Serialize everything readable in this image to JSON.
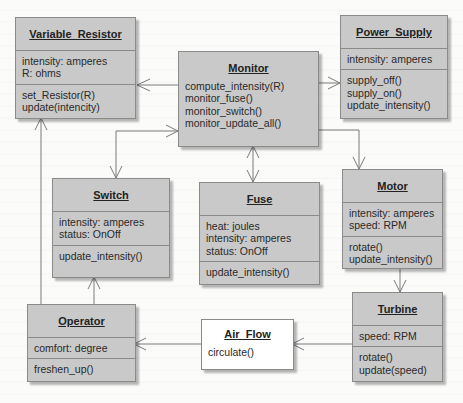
{
  "diagram": {
    "type": "UML class diagram",
    "colors": {
      "class_fill": "#c9c9c9",
      "class_border": "#8a8a8a",
      "air_flow_fill": "#ffffff",
      "connector": "#7a7a7a",
      "background": "#fbfbfa"
    },
    "classes": {
      "variable_resistor": {
        "name": "Variable_Resistor",
        "attributes": [
          "intensity:  amperes",
          "R:  ohms"
        ],
        "operations": [
          "set_Resistor(R)",
          "update(intencity)"
        ]
      },
      "monitor": {
        "name": "Monitor",
        "attributes": [],
        "operations": [
          "compute_intensity(R)",
          "monitor_fuse()",
          "monitor_switch()",
          "monitor_update_all()"
        ]
      },
      "power_supply": {
        "name": "Power_Supply",
        "attributes": [
          "intensity:  amperes"
        ],
        "operations": [
          "supply_off()",
          "supply_on()",
          "update_intensity()"
        ]
      },
      "switch": {
        "name": "Switch",
        "attributes": [
          "intensity:  amperes",
          "status:  OnOff"
        ],
        "operations": [
          "update_intensity()"
        ]
      },
      "fuse": {
        "name": "Fuse",
        "attributes": [
          "heat:  joules",
          "intensity:  amperes",
          "status:  OnOff"
        ],
        "operations": [
          "update_intensity()"
        ]
      },
      "motor": {
        "name": "Motor",
        "attributes": [
          "intensity:  amperes",
          "speed:  RPM"
        ],
        "operations": [
          "rotate()",
          "update_intensity()"
        ]
      },
      "operator": {
        "name": "Operator",
        "attributes": [
          "comfort:  degree"
        ],
        "operations": [
          "freshen_up()"
        ]
      },
      "air_flow": {
        "name": "Air_Flow",
        "attributes": [],
        "operations": [
          "circulate()"
        ]
      },
      "turbine": {
        "name": "Turbine",
        "attributes": [
          "speed:  RPM"
        ],
        "operations": [
          "rotate()",
          "update(speed)"
        ]
      }
    },
    "associations": [
      {
        "from": "Monitor",
        "to": "Variable_Resistor",
        "arrow": "to"
      },
      {
        "from": "Monitor",
        "to": "Power_Supply",
        "arrow": "to"
      },
      {
        "from": "Monitor",
        "to": "Switch",
        "arrow": "both"
      },
      {
        "from": "Monitor",
        "to": "Fuse",
        "arrow": "both"
      },
      {
        "from": "Monitor",
        "to": "Motor",
        "arrow": "to"
      },
      {
        "from": "Operator",
        "to": "Variable_Resistor",
        "arrow": "to"
      },
      {
        "from": "Operator",
        "to": "Switch",
        "arrow": "to"
      },
      {
        "from": "Motor",
        "to": "Turbine",
        "arrow": "to"
      },
      {
        "from": "Turbine",
        "to": "Air_Flow",
        "arrow": "to"
      },
      {
        "from": "Air_Flow",
        "to": "Operator",
        "arrow": "to"
      }
    ]
  }
}
